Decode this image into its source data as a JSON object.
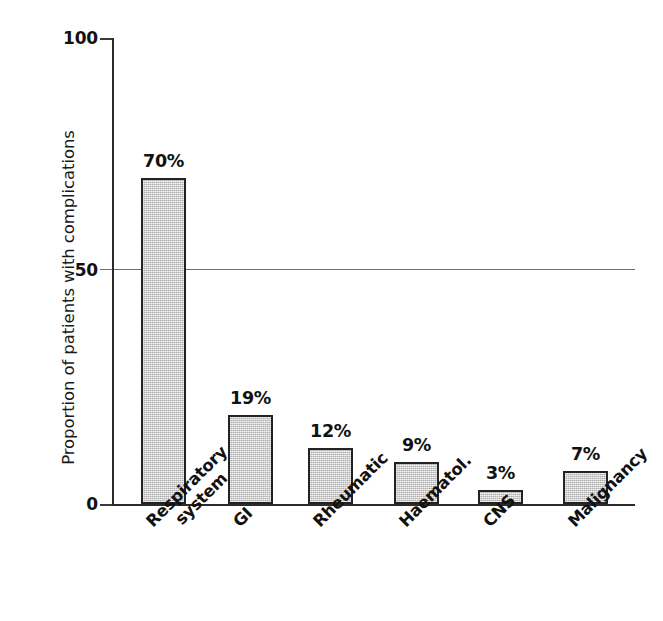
{
  "chart_data": {
    "type": "bar",
    "title": "",
    "xlabel": "",
    "ylabel": "Proportion of patients with complications",
    "categories": [
      "Respiratory system",
      "GI",
      "Rheumatic",
      "Haematol.",
      "CNS",
      "Malignancy"
    ],
    "category_lines": [
      [
        "Respiratory",
        "system"
      ],
      [
        "GI"
      ],
      [
        "Rheumatic"
      ],
      [
        "Haematol."
      ],
      [
        "CNS"
      ],
      [
        "Malignancy"
      ]
    ],
    "values": [
      70,
      19,
      12,
      9,
      3,
      7
    ],
    "value_labels": [
      "70%",
      "19%",
      "12%",
      "9%",
      "3%",
      "7%"
    ],
    "ylim": [
      0,
      100
    ],
    "yticks": [
      0,
      50,
      100
    ],
    "ytick_labels": [
      "0",
      "50",
      "100"
    ],
    "grid": "single horizontal line at y=50",
    "legend": "none",
    "bar_fill_color": "#c2c2c2",
    "bar_border_color": "#232323",
    "axis_color": "#2b2b2b",
    "gridline_color": "#6f6f6f",
    "background_color": "#ffffff",
    "label_rotation_degrees": 45
  },
  "axis": {
    "y_title": "Proportion of patients with complications",
    "tick_100": "100",
    "tick_50": "50",
    "tick_0": "0"
  },
  "bars": [
    {
      "label": "Respiratory system",
      "value_label": "70%",
      "line1": "Respiratory",
      "line2": "system"
    },
    {
      "label": "GI",
      "value_label": "19%",
      "line1": "GI",
      "line2": ""
    },
    {
      "label": "Rheumatic",
      "value_label": "12%",
      "line1": "Rheumatic",
      "line2": ""
    },
    {
      "label": "Haematol.",
      "value_label": "9%",
      "line1": "Haematol.",
      "line2": ""
    },
    {
      "label": "CNS",
      "value_label": "3%",
      "line1": "CNS",
      "line2": ""
    },
    {
      "label": "Malignancy",
      "value_label": "7%",
      "line1": "Malignancy",
      "line2": ""
    }
  ]
}
